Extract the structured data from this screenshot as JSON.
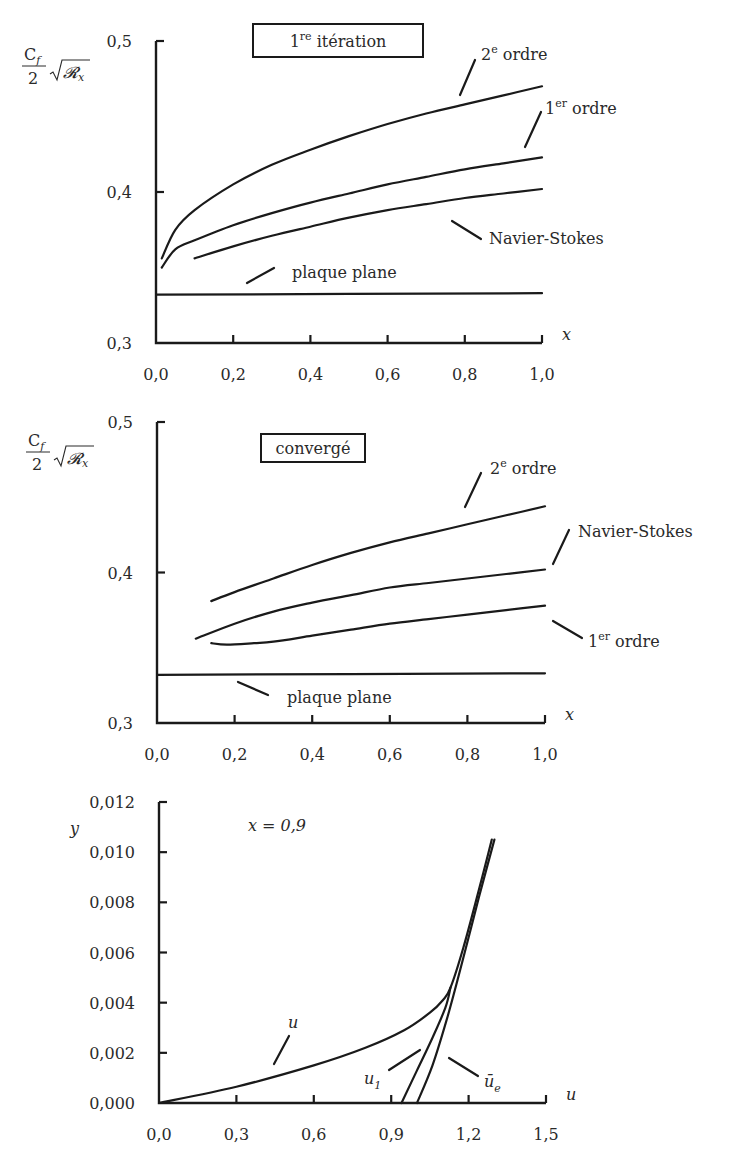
{
  "chart_data": [
    {
      "type": "line",
      "title": "1re itération",
      "title_parts": {
        "main": "1",
        "sup": "re",
        "rest": " itération"
      },
      "ylabel": "Cf/2 √Rx",
      "xlabel": "x",
      "xlim": [
        0.0,
        1.0
      ],
      "ylim": [
        0.3,
        0.5
      ],
      "xticks": [
        "0,0",
        "0,2",
        "0,4",
        "0,6",
        "0,8",
        "1,0"
      ],
      "yticks": [
        "0,3",
        "0,4",
        "0,5"
      ],
      "grid": false,
      "series": [
        {
          "name": "2e ordre",
          "label_main": "2",
          "label_sup": "e",
          "label_rest": " ordre",
          "x": [
            0.015,
            0.05,
            0.1,
            0.2,
            0.3,
            0.4,
            0.5,
            0.6,
            0.7,
            0.8,
            0.9,
            1.0
          ],
          "values": [
            0.356,
            0.375,
            0.388,
            0.405,
            0.418,
            0.428,
            0.437,
            0.445,
            0.452,
            0.458,
            0.464,
            0.47
          ]
        },
        {
          "name": "1er ordre",
          "label_main": "1",
          "label_sup": "er",
          "label_rest": " ordre",
          "x": [
            0.015,
            0.05,
            0.1,
            0.2,
            0.3,
            0.4,
            0.5,
            0.6,
            0.7,
            0.8,
            0.9,
            1.0
          ],
          "values": [
            0.35,
            0.362,
            0.368,
            0.378,
            0.386,
            0.393,
            0.399,
            0.405,
            0.41,
            0.415,
            0.419,
            0.423
          ]
        },
        {
          "name": "Navier-Stokes",
          "x": [
            0.1,
            0.2,
            0.3,
            0.4,
            0.5,
            0.6,
            0.7,
            0.8,
            0.9,
            1.0
          ],
          "values": [
            0.356,
            0.364,
            0.371,
            0.377,
            0.383,
            0.388,
            0.392,
            0.396,
            0.399,
            0.402
          ]
        },
        {
          "name": "plaque plane",
          "x": [
            0.0,
            1.0
          ],
          "values": [
            0.332,
            0.333
          ]
        }
      ]
    },
    {
      "type": "line",
      "title": "convergé",
      "ylabel": "Cf/2 √Rx",
      "xlabel": "x",
      "xlim": [
        0.0,
        1.0
      ],
      "ylim": [
        0.3,
        0.5
      ],
      "xticks": [
        "0,0",
        "0,2",
        "0,4",
        "0,6",
        "0,8",
        "1,0"
      ],
      "yticks": [
        "0,3",
        "0,4",
        "0,5"
      ],
      "grid": false,
      "series": [
        {
          "name": "2e ordre",
          "label_main": "2",
          "label_sup": "e",
          "label_rest": " ordre",
          "x": [
            0.14,
            0.2,
            0.3,
            0.4,
            0.5,
            0.6,
            0.7,
            0.8,
            0.9,
            1.0
          ],
          "values": [
            0.381,
            0.387,
            0.396,
            0.405,
            0.413,
            0.42,
            0.426,
            0.432,
            0.438,
            0.444
          ]
        },
        {
          "name": "Navier-Stokes",
          "x": [
            0.1,
            0.2,
            0.3,
            0.4,
            0.5,
            0.6,
            0.7,
            0.8,
            0.9,
            1.0
          ],
          "values": [
            0.356,
            0.366,
            0.374,
            0.38,
            0.385,
            0.39,
            0.393,
            0.396,
            0.399,
            0.402
          ]
        },
        {
          "name": "1er ordre",
          "label_main": "1",
          "label_sup": "er",
          "label_rest": " ordre",
          "x": [
            0.14,
            0.18,
            0.25,
            0.3,
            0.4,
            0.5,
            0.6,
            0.7,
            0.8,
            0.9,
            1.0
          ],
          "values": [
            0.353,
            0.352,
            0.353,
            0.354,
            0.358,
            0.362,
            0.366,
            0.369,
            0.372,
            0.375,
            0.378
          ]
        },
        {
          "name": "plaque plane",
          "x": [
            0.0,
            1.0
          ],
          "values": [
            0.332,
            0.333
          ]
        }
      ]
    },
    {
      "type": "line",
      "title": "x = 0,9",
      "ylabel": "y",
      "xlabel": "u",
      "xlim": [
        0.0,
        1.5
      ],
      "ylim": [
        0.0,
        0.012
      ],
      "xticks": [
        "0,0",
        "0,3",
        "0,6",
        "0,9",
        "1,2",
        "1,5"
      ],
      "yticks": [
        "0,000",
        "0,002",
        "0,004",
        "0,006",
        "0,008",
        "0,010",
        "0,012"
      ],
      "grid": false,
      "series": [
        {
          "name": "u",
          "x": [
            0.0,
            0.3,
            0.6,
            0.8,
            0.95,
            1.05,
            1.1,
            1.13,
            1.18,
            1.24,
            1.29
          ],
          "values": [
            0.0,
            0.00065,
            0.0015,
            0.0022,
            0.0029,
            0.0036,
            0.0041,
            0.0046,
            0.0062,
            0.0085,
            0.0105
          ]
        },
        {
          "name": "u₁",
          "label_main": "u",
          "label_sub": "1",
          "x": [
            0.94,
            1.0,
            1.06,
            1.11,
            1.13
          ],
          "values": [
            0.0,
            0.0013,
            0.0026,
            0.0038,
            0.0046
          ]
        },
        {
          "name": "ūe",
          "label_main": "ū",
          "label_sub": "e",
          "x": [
            1.0,
            1.06,
            1.12,
            1.18,
            1.24,
            1.3
          ],
          "values": [
            0.0,
            0.0015,
            0.0035,
            0.0058,
            0.0082,
            0.0105
          ]
        }
      ]
    }
  ],
  "labels": {
    "ylabel_numer": "C",
    "ylabel_numer_sub": "f",
    "ylabel_denom": "2",
    "ylabel_rad": "𝓡",
    "ylabel_rad_sub": "x",
    "chart3_annotation": "x = 0,9"
  }
}
